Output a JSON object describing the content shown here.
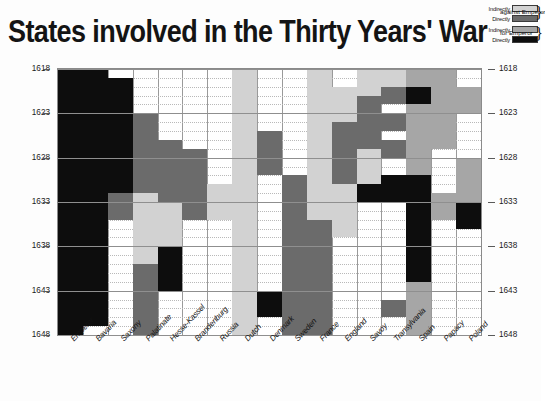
{
  "title": "States involved in the Thirty Years' War",
  "legend": {
    "groups": [
      {
        "category": "against Emperor",
        "entries": [
          {
            "label": "Indirectly",
            "key": "indirect-against",
            "color": "#d2d2d2"
          },
          {
            "label": "Directly",
            "key": "direct-against",
            "color": "#6b6b6b"
          }
        ]
      },
      {
        "category": "for Emperor",
        "entries": [
          {
            "label": "Indirectly",
            "key": "indirect-for",
            "color": "#a6a6a6"
          },
          {
            "label": "Directly",
            "key": "direct-for",
            "color": "#0d0d0d"
          }
        ]
      }
    ]
  },
  "chart_data": {
    "type": "heatmap",
    "title": "States involved in the Thirty Years' War",
    "xlabel": "",
    "ylabel": "",
    "ylim": [
      1618,
      1648
    ],
    "y_tick_step": 5,
    "grid": true,
    "legend_position": "top-right",
    "y_ticks": [
      1618,
      1623,
      1628,
      1633,
      1638,
      1643,
      1648
    ],
    "year_start": 1618,
    "year_end": 1648,
    "value_levels": {
      "0": "none",
      "1": "indirect-against",
      "2": "direct-against",
      "3": "indirect-for",
      "4": "direct-for"
    },
    "categories": [
      "Emperor",
      "Bavaria",
      "Saxony",
      "Palatinate",
      "Hesse-Kassel",
      "Brandenburg",
      "Russia",
      "Dutch",
      "Denmark",
      "Sweden",
      "France",
      "England",
      "Savoy",
      "Transylvania",
      "Spain",
      "Papacy",
      "Poland"
    ],
    "series": [
      {
        "name": "Emperor",
        "spans": [
          {
            "from": 1618,
            "to": 1648,
            "value": "direct-for"
          }
        ]
      },
      {
        "name": "Bavaria",
        "spans": [
          {
            "from": 1618,
            "to": 1619,
            "value": "direct-for"
          },
          {
            "from": 1620,
            "to": 1646,
            "value": "direct-for"
          },
          {
            "from": 1647,
            "to": 1647,
            "value": "none"
          },
          {
            "from": 1648,
            "to": 1648,
            "value": "direct-for"
          }
        ]
      },
      {
        "name": "Saxony",
        "spans": [
          {
            "from": 1619,
            "to": 1631,
            "value": "direct-for"
          },
          {
            "from": 1632,
            "to": 1634,
            "value": "direct-against"
          },
          {
            "from": 1635,
            "to": 1648,
            "value": "none"
          }
        ]
      },
      {
        "name": "Palatinate",
        "spans": [
          {
            "from": 1618,
            "to": 1622,
            "value": "none"
          },
          {
            "from": 1623,
            "to": 1631,
            "value": "direct-against"
          },
          {
            "from": 1632,
            "to": 1639,
            "value": "indirect-against"
          },
          {
            "from": 1640,
            "to": 1648,
            "value": "direct-against"
          }
        ]
      },
      {
        "name": "Hesse-Kassel",
        "spans": [
          {
            "from": 1626,
            "to": 1632,
            "value": "direct-against"
          },
          {
            "from": 1633,
            "to": 1637,
            "value": "indirect-against"
          },
          {
            "from": 1638,
            "to": 1642,
            "value": "direct-for"
          },
          {
            "from": 1643,
            "to": 1648,
            "value": "none"
          }
        ]
      },
      {
        "name": "Brandenburg",
        "spans": [
          {
            "from": 1627,
            "to": 1634,
            "value": "direct-against"
          },
          {
            "from": 1635,
            "to": 1648,
            "value": "none"
          }
        ]
      },
      {
        "name": "Russia",
        "spans": [
          {
            "from": 1631,
            "to": 1634,
            "value": "indirect-against"
          },
          {
            "from": 1635,
            "to": 1648,
            "value": "none"
          }
        ]
      },
      {
        "name": "Dutch",
        "spans": [
          {
            "from": 1618,
            "to": 1648,
            "value": "indirect-against"
          }
        ]
      },
      {
        "name": "Denmark",
        "spans": [
          {
            "from": 1625,
            "to": 1629,
            "value": "direct-against"
          },
          {
            "from": 1630,
            "to": 1642,
            "value": "none"
          },
          {
            "from": 1643,
            "to": 1645,
            "value": "direct-for"
          },
          {
            "from": 1646,
            "to": 1648,
            "value": "none"
          }
        ]
      },
      {
        "name": "Sweden",
        "spans": [
          {
            "from": 1630,
            "to": 1648,
            "value": "direct-against"
          }
        ]
      },
      {
        "name": "France",
        "spans": [
          {
            "from": 1618,
            "to": 1625,
            "value": "indirect-against"
          },
          {
            "from": 1626,
            "to": 1634,
            "value": "indirect-against"
          },
          {
            "from": 1635,
            "to": 1648,
            "value": "direct-against"
          }
        ]
      },
      {
        "name": "England",
        "spans": [
          {
            "from": 1620,
            "to": 1623,
            "value": "indirect-against"
          },
          {
            "from": 1624,
            "to": 1630,
            "value": "direct-against"
          },
          {
            "from": 1631,
            "to": 1636,
            "value": "indirect-against"
          },
          {
            "from": 1637,
            "to": 1648,
            "value": "none"
          }
        ]
      },
      {
        "name": "Savoy",
        "spans": [
          {
            "from": 1618,
            "to": 1620,
            "value": "indirect-against"
          },
          {
            "from": 1621,
            "to": 1626,
            "value": "direct-against"
          },
          {
            "from": 1627,
            "to": 1630,
            "value": "indirect-against"
          },
          {
            "from": 1631,
            "to": 1632,
            "value": "direct-for"
          },
          {
            "from": 1633,
            "to": 1648,
            "value": "none"
          }
        ]
      },
      {
        "name": "Transylvania",
        "spans": [
          {
            "from": 1618,
            "to": 1619,
            "value": "indirect-against"
          },
          {
            "from": 1620,
            "to": 1621,
            "value": "direct-against"
          },
          {
            "from": 1623,
            "to": 1624,
            "value": "direct-against"
          },
          {
            "from": 1626,
            "to": 1627,
            "value": "direct-against"
          },
          {
            "from": 1630,
            "to": 1632,
            "value": "direct-for"
          },
          {
            "from": 1644,
            "to": 1645,
            "value": "direct-against"
          }
        ]
      },
      {
        "name": "Spain",
        "spans": [
          {
            "from": 1618,
            "to": 1619,
            "value": "indirect-for"
          },
          {
            "from": 1620,
            "to": 1621,
            "value": "direct-for"
          },
          {
            "from": 1622,
            "to": 1629,
            "value": "indirect-for"
          },
          {
            "from": 1630,
            "to": 1641,
            "value": "direct-for"
          },
          {
            "from": 1642,
            "to": 1648,
            "value": "indirect-for"
          }
        ]
      },
      {
        "name": "Papacy",
        "spans": [
          {
            "from": 1618,
            "to": 1619,
            "value": "indirect-for"
          },
          {
            "from": 1620,
            "to": 1626,
            "value": "indirect-for"
          },
          {
            "from": 1627,
            "to": 1631,
            "value": "none"
          },
          {
            "from": 1632,
            "to": 1634,
            "value": "indirect-for"
          },
          {
            "from": 1635,
            "to": 1648,
            "value": "none"
          }
        ]
      },
      {
        "name": "Poland",
        "spans": [
          {
            "from": 1620,
            "to": 1622,
            "value": "indirect-for"
          },
          {
            "from": 1623,
            "to": 1627,
            "value": "none"
          },
          {
            "from": 1628,
            "to": 1632,
            "value": "indirect-for"
          },
          {
            "from": 1633,
            "to": 1635,
            "value": "direct-for"
          },
          {
            "from": 1636,
            "to": 1648,
            "value": "none"
          }
        ]
      }
    ]
  }
}
